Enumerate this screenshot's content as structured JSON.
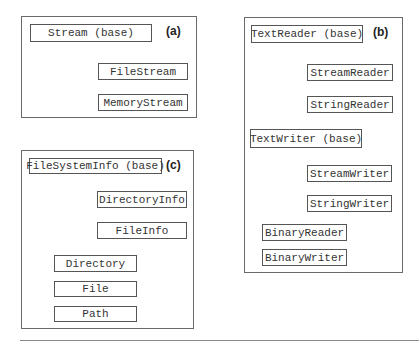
{
  "panels": {
    "a": {
      "label": "(a)",
      "base": "Stream (base)",
      "children": [
        "FileStream",
        "MemoryStream"
      ]
    },
    "b": {
      "label": "(b)",
      "reader_base": "TextReader (base)",
      "reader_children": [
        "StreamReader",
        "StringReader"
      ],
      "writer_base": "TextWriter (base)",
      "writer_children": [
        "StreamWriter",
        "StringWriter"
      ],
      "standalone": [
        "BinaryReader",
        "BinaryWriter"
      ]
    },
    "c": {
      "label": "(c)",
      "base": "FileSystemInfo (base)",
      "children": [
        "DirectoryInfo",
        "FileInfo"
      ],
      "standalone": [
        "Directory",
        "File",
        "Path"
      ]
    }
  },
  "colors": {
    "border": "#555555",
    "line": "#333333",
    "text": "#333333"
  }
}
